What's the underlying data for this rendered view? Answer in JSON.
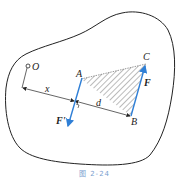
{
  "header": {
    "cut_text": "一一一一一一一一一一一一一一一一一一一一一一一"
  },
  "diagram": {
    "labels": {
      "origin": "O",
      "point_a": "A",
      "point_b": "B",
      "point_c": "C",
      "force": "F",
      "force_prime": "F'",
      "distance_x": "x",
      "distance_d": "d"
    },
    "colors": {
      "force_lines": "#2f7fd6",
      "outline": "#222222",
      "hatch": "#555555",
      "caption": "#7aa0cf"
    }
  },
  "caption": {
    "text": "图 2-24"
  }
}
